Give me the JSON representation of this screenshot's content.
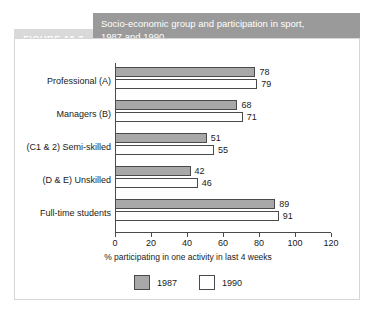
{
  "figure": {
    "label": "FIGURE 10.3",
    "title_line1": "Socio-economic group and participation in sport,",
    "title_line2": "1987 and 1990"
  },
  "colors": {
    "title_bar": "#9a9a9a",
    "label_box": "#d9d9d9",
    "series_1987": "#a8a8a8",
    "series_1990": "#ffffff",
    "axis": "#4a4a4a",
    "frame": "#d6d6d6"
  },
  "chart_data": {
    "type": "bar",
    "orientation": "horizontal",
    "title": "Socio-economic group and participation in sport, 1987 and 1990",
    "categories": [
      "Professional (A)",
      "Managers (B)",
      "(C1 & 2) Semi-skilled",
      "(D & E) Unskilled",
      "Full-time students"
    ],
    "series": [
      {
        "name": "1987",
        "values": [
          78,
          68,
          51,
          42,
          89
        ]
      },
      {
        "name": "1990",
        "values": [
          79,
          71,
          55,
          46,
          91
        ]
      }
    ],
    "xlabel": "% participating in one activity in last 4 weeks",
    "ylabel": "",
    "xlim": [
      0,
      120
    ],
    "xticks": [
      0,
      20,
      40,
      60,
      80,
      100,
      120
    ],
    "xtick_labels": [
      "0",
      "20",
      "40",
      "60",
      "80",
      "100",
      "120"
    ],
    "grid": false,
    "legend_position": "bottom-center",
    "legend_entries": [
      "1987",
      "1990"
    ],
    "data_labels": true
  }
}
